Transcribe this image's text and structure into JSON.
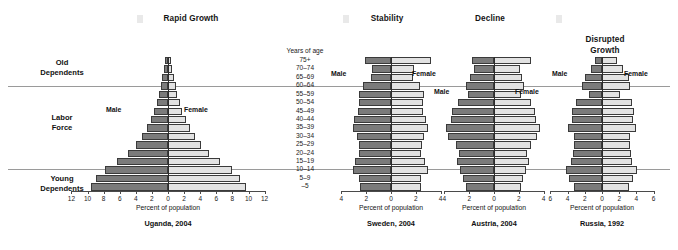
{
  "figure": {
    "axis_title": "Percent of population",
    "age_header": "Years of age",
    "male_label": "Male",
    "female_label": "Female",
    "male_color": "#7b7b7b",
    "female_color": "#e2e2e2"
  },
  "side_categories": [
    {
      "id": "old-dependents",
      "label": "Old\nDependents"
    },
    {
      "id": "labor-force",
      "label": "Labor\nForce"
    },
    {
      "id": "young-dependents",
      "label": "Young\nDependents"
    }
  ],
  "age_groups": [
    "75+",
    "70–74",
    "65–69",
    "60–64",
    "55–59",
    "50–54",
    "45–49",
    "40–44",
    "35–39",
    "30–34",
    "25–29",
    "20–24",
    "15–19",
    "10–14",
    "5–9",
    "–5"
  ],
  "chart_data": [
    {
      "type": "bar",
      "id": "uganda",
      "title": "Rapid Growth",
      "caption": "Uganda, 2004",
      "xlabel": "Percent of population",
      "ylabel": "Years of age",
      "xlim": [
        -12,
        12
      ],
      "ticks": [
        12,
        10,
        8,
        6,
        4,
        2,
        0,
        2,
        4,
        6,
        8,
        10,
        12
      ],
      "categories": [
        "75+",
        "70–74",
        "65–69",
        "60–64",
        "55–59",
        "50–54",
        "45–49",
        "40–44",
        "35–39",
        "30–34",
        "25–29",
        "20–24",
        "15–19",
        "10–14",
        "5–9",
        "–5"
      ],
      "series": [
        {
          "name": "Male",
          "values": [
            0.35,
            0.5,
            0.7,
            0.9,
            1.1,
            1.4,
            1.7,
            2.1,
            2.6,
            3.2,
            4.0,
            5.0,
            6.3,
            7.8,
            8.9,
            9.6
          ]
        },
        {
          "name": "Female",
          "values": [
            0.4,
            0.55,
            0.75,
            0.95,
            1.15,
            1.45,
            1.75,
            2.2,
            2.7,
            3.3,
            4.1,
            5.1,
            6.4,
            7.9,
            9.0,
            9.7
          ]
        }
      ]
    },
    {
      "type": "bar",
      "id": "sweden",
      "title": "Stability",
      "caption": "Sweden, 2004",
      "xlabel": "Percent of population",
      "ylabel": "Years of age",
      "xlim": [
        -4,
        4
      ],
      "ticks": [
        4,
        2,
        0,
        2,
        4
      ],
      "categories": [
        "75+",
        "70–74",
        "65–69",
        "60–64",
        "55–59",
        "50–54",
        "45–49",
        "40–44",
        "35–39",
        "30–34",
        "25–29",
        "20–24",
        "15–19",
        "10–14",
        "5–9",
        "–5"
      ],
      "series": [
        {
          "name": "Male",
          "values": [
            2.1,
            1.55,
            1.6,
            2.25,
            2.6,
            2.55,
            2.65,
            2.95,
            3.1,
            2.75,
            2.6,
            2.55,
            2.9,
            3.1,
            2.55,
            2.5
          ]
        },
        {
          "name": "Female",
          "values": [
            3.2,
            1.85,
            1.8,
            2.35,
            2.7,
            2.55,
            2.6,
            2.85,
            3.0,
            2.65,
            2.5,
            2.45,
            2.75,
            2.95,
            2.45,
            2.4
          ]
        }
      ]
    },
    {
      "type": "bar",
      "id": "austria",
      "title": "Decline",
      "caption": "Austria, 2004",
      "xlabel": "Percent of population",
      "ylabel": "Years of age",
      "xlim": [
        -4,
        4
      ],
      "ticks": [
        4,
        2,
        0,
        2,
        4
      ],
      "categories": [
        "75+",
        "70–74",
        "65–69",
        "60–64",
        "55–59",
        "50–54",
        "45–49",
        "40–44",
        "35–39",
        "30–34",
        "25–29",
        "20–24",
        "15–19",
        "10–14",
        "5–9",
        "–5"
      ],
      "series": [
        {
          "name": "Male",
          "values": [
            1.75,
            1.6,
            1.95,
            2.25,
            2.1,
            2.9,
            3.35,
            3.45,
            3.85,
            3.7,
            3.1,
            2.85,
            2.95,
            2.75,
            2.5,
            2.25
          ]
        },
        {
          "name": "Female",
          "values": [
            3.0,
            2.1,
            2.25,
            2.4,
            2.2,
            2.95,
            3.3,
            3.35,
            3.7,
            3.5,
            2.95,
            2.7,
            2.8,
            2.6,
            2.35,
            2.15
          ]
        }
      ]
    },
    {
      "type": "bar",
      "id": "russia",
      "title": "Disrupted\nGrowth",
      "caption": "Russia, 1992",
      "xlabel": "Percent of population",
      "ylabel": "Years of age",
      "xlim": [
        -6,
        6
      ],
      "ticks": [
        6,
        4,
        2,
        0,
        2,
        4,
        6
      ],
      "categories": [
        "75+",
        "70–74",
        "65–69",
        "60–64",
        "55–59",
        "50–54",
        "45–49",
        "40–44",
        "35–39",
        "30–34",
        "25–29",
        "20–24",
        "15–19",
        "10–14",
        "5–9",
        "–5"
      ],
      "series": [
        {
          "name": "Male",
          "values": [
            0.8,
            1.25,
            2.0,
            2.3,
            1.55,
            3.05,
            3.5,
            3.45,
            3.9,
            3.2,
            3.3,
            3.4,
            3.6,
            4.2,
            3.8,
            3.3
          ]
        },
        {
          "name": "Female",
          "values": [
            1.7,
            2.4,
            3.1,
            3.3,
            2.1,
            3.5,
            3.7,
            3.6,
            3.95,
            3.25,
            3.3,
            3.35,
            3.5,
            4.05,
            3.65,
            3.15
          ]
        }
      ]
    }
  ],
  "panel_sex_labels": [
    {
      "chart": "uganda",
      "male": "Male",
      "female": "Female"
    },
    {
      "chart": "sweden",
      "male": "Male",
      "female": "Female"
    },
    {
      "chart": "austria",
      "male": "Male",
      "female": "Female"
    },
    {
      "chart": "russia",
      "male": "Male",
      "female": "Female"
    }
  ]
}
